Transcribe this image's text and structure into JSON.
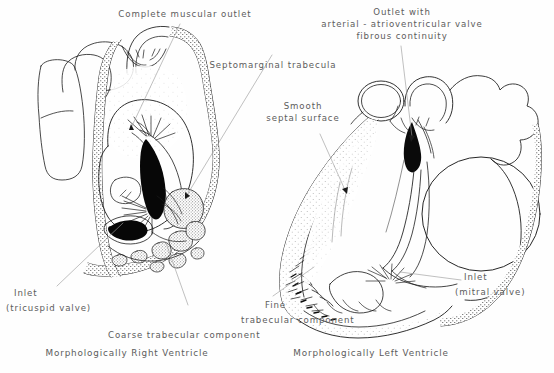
{
  "figure": {
    "background_color": "#fefefe",
    "ink_color": "#1a1a1a",
    "text_color": "#5c5c5c",
    "leader_color": "#9a9a9a"
  },
  "labels": {
    "complete_muscular_outlet": "Complete muscular outlet",
    "septomarginal_trabecula": "Septomarginal trabecula",
    "outlet_with_fibrous_continuity_line1": "Outlet with",
    "outlet_with_fibrous_continuity_line2": "arterial - atrioventricular valve",
    "outlet_with_fibrous_continuity_line3": "fibrous continuity",
    "smooth_septal_surface_line1": "Smooth",
    "smooth_septal_surface_line2": "septal surface",
    "inlet_tricuspid_line1": "Inlet",
    "inlet_tricuspid_line2": "(tricuspid valve)",
    "inlet_mitral_line1": "Inlet",
    "inlet_mitral_line2": "(mitral valve)",
    "coarse_trabecular_component": "Coarse trabecular component",
    "fine_trabecular_component_line1": "Fine",
    "fine_trabecular_component_line2": "trabecular component"
  },
  "captions": {
    "right_ventricle": "Morphologically Right Ventricle",
    "left_ventricle": "Morphologically Left Ventricle",
    "cut_off_line": "partially cut off text"
  },
  "panels": {
    "left_panel_name": "right-ventricle-drawing",
    "right_panel_name": "left-ventricle-drawing"
  }
}
